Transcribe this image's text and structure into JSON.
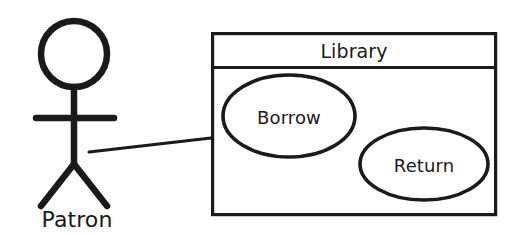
{
  "diagram": {
    "kind": "uml-use-case-diagram",
    "background_color": "#ffffff",
    "stroke_color": "#1a1a1a",
    "actor": {
      "name": "Patron",
      "icon": "stick-figure-actor-icon"
    },
    "system_boundary": {
      "title": "Library",
      "use_cases": [
        {
          "label": "Borrow"
        },
        {
          "label": "Return"
        }
      ]
    },
    "associations": [
      {
        "from": "Patron",
        "to": "Library"
      }
    ]
  }
}
